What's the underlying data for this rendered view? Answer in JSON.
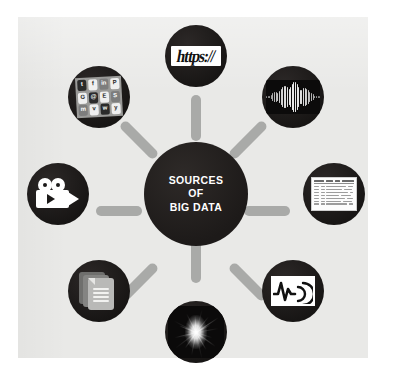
{
  "diagram": {
    "title": "SOURCES OF BIG DATA",
    "type": "hub-and-spoke",
    "hub": {
      "line1": "SOURCES",
      "line2": "OF",
      "line3": "BIG DATA",
      "text_color": "#ffffff",
      "fill_color": "#231f1e"
    },
    "background": {
      "panel_color": "#e9e9e7",
      "page_color": "#ffffff",
      "spoke_color": "#a9aaa8",
      "node_fill_color": "#1e1b1a"
    },
    "node_count": 8,
    "nodes": [
      {
        "id": "web",
        "position": "top",
        "icon": "https-url-icon",
        "label": "https://",
        "description": "Web / URL data"
      },
      {
        "id": "social",
        "position": "top-left",
        "icon": "social-media-apps-icon",
        "label": "Social media apps",
        "description": "Social network application icon collage",
        "apps": [
          "t",
          "f",
          "in",
          "P",
          "G",
          "@",
          "E",
          "S",
          "m",
          "v",
          "w",
          "y"
        ]
      },
      {
        "id": "audio",
        "position": "top-right",
        "icon": "audio-waveform-icon",
        "label": "Audio waveform",
        "description": "Sound wave / spectrogram"
      },
      {
        "id": "video",
        "position": "left",
        "icon": "video-camera-icon",
        "label": "Video camera",
        "description": "Movie camera with play button"
      },
      {
        "id": "tabular",
        "position": "right",
        "icon": "spreadsheet-table-icon",
        "label": "Spreadsheet table",
        "description": "Structured tabular records"
      },
      {
        "id": "documents",
        "position": "bottom-left",
        "icon": "documents-stack-icon",
        "label": "Documents",
        "description": "Stack of text document pages"
      },
      {
        "id": "sensor",
        "position": "bottom-right",
        "icon": "sensor-signal-icon",
        "label": "Sensor signal",
        "description": "Pulse waveform with broadcast arcs"
      },
      {
        "id": "science",
        "position": "bottom",
        "icon": "particle-collision-icon",
        "label": "Particle collision",
        "description": "Scientific experiment imagery"
      }
    ]
  }
}
